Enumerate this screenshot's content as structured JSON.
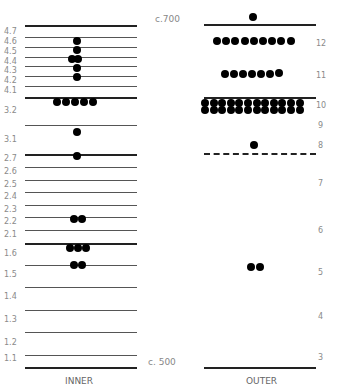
{
  "inner": {
    "title": "INNER",
    "levels": [
      "4.7",
      "4.6",
      "4.5",
      "4.4",
      "4.3",
      "4.2",
      "4.1",
      "3.2",
      "3.1",
      "2.7",
      "2.6",
      "2.5",
      "2.4",
      "2.3",
      "2.2",
      "2.1",
      "1.6",
      "1.5",
      "1.4",
      "1.3",
      "1.2",
      "1.1"
    ]
  },
  "outer": {
    "title": "OUTER",
    "levels": [
      "12",
      "11",
      "10",
      "9",
      "8",
      "7",
      "6",
      "5",
      "4",
      "3"
    ]
  },
  "scale": {
    "top": "c.700",
    "bottom": "c. 500"
  },
  "chart_data": {
    "type": "scatter",
    "title": "",
    "series": [
      {
        "name": "INNER",
        "counts": {
          "4.7": 0,
          "4.6": 1,
          "4.5": 1,
          "4.4": 2,
          "4.3": 1,
          "4.2": 1,
          "4.1": 0,
          "3.2": 5,
          "3.1": 1,
          "2.7": 1,
          "2.6": 0,
          "2.5": 0,
          "2.4": 0,
          "2.3": 0,
          "2.2": 2,
          "2.1": 0,
          "1.6": 3,
          "1.5": 2,
          "1.4": 0,
          "1.3": 0,
          "1.2": 0,
          "1.1": 0
        }
      },
      {
        "name": "OUTER",
        "counts": {
          "above 12": 1,
          "12": 9,
          "11": 7,
          "10": 24,
          "9": 0,
          "8": 1,
          "7": 0,
          "6": 0,
          "5": 2,
          "4": 0,
          "3": 0
        }
      }
    ],
    "date_range": [
      "c. 500",
      "c.700"
    ]
  }
}
